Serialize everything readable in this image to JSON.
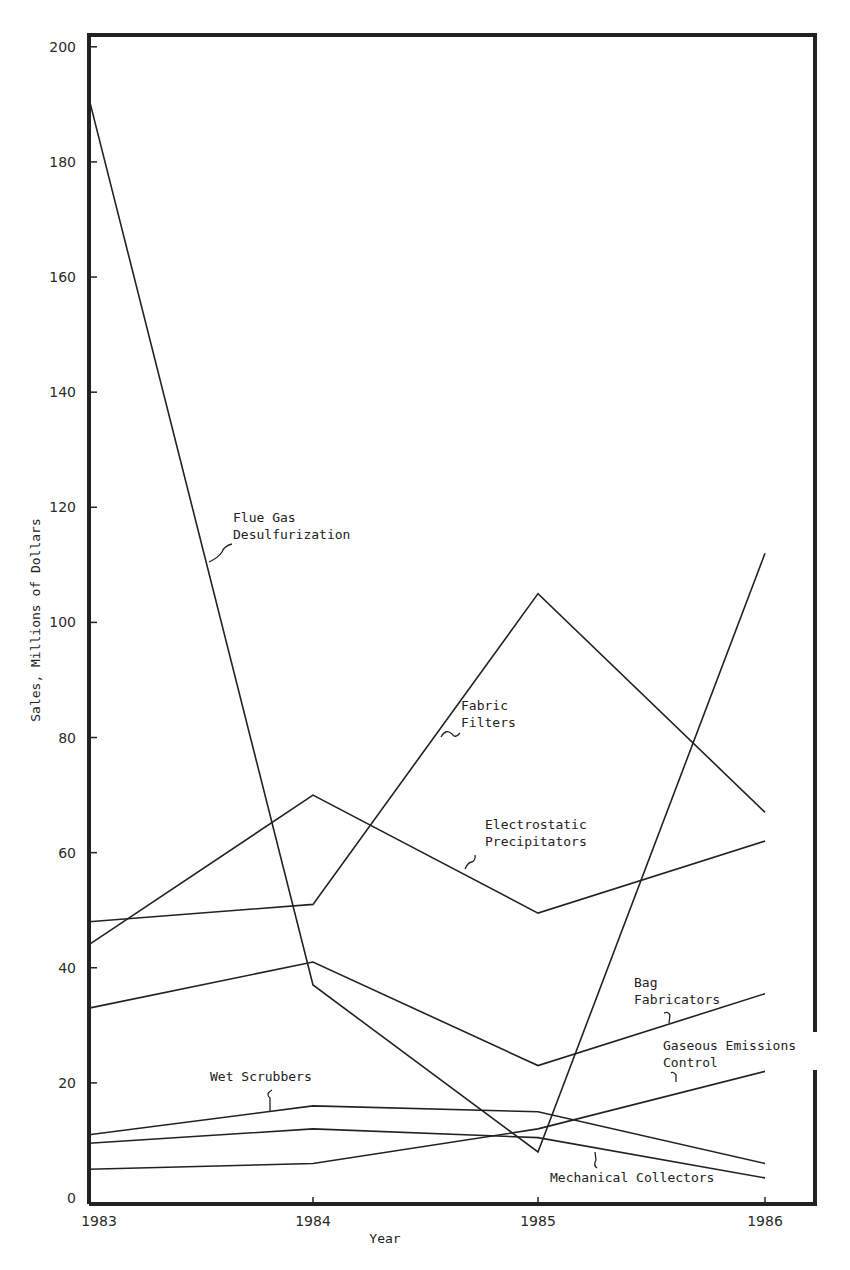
{
  "chart_data": {
    "type": "line",
    "title": "",
    "xlabel": "Year",
    "ylabel": "Sales, Millions of Dollars",
    "x": [
      1983,
      1984,
      1985,
      1986
    ],
    "xticks": [
      "1983",
      "1984",
      "1985",
      "1986"
    ],
    "yticks": [
      "0",
      "20",
      "40",
      "60",
      "80",
      "100",
      "120",
      "140",
      "160",
      "180",
      "200"
    ],
    "ylim": [
      0,
      200
    ],
    "grid": false,
    "legend": "inline labels",
    "series": [
      {
        "name": "Flue Gas Desulfurization",
        "label_lines": [
          "Flue Gas",
          "Desulfurization"
        ],
        "values": [
          191,
          37,
          8,
          112
        ]
      },
      {
        "name": "Fabric Filters",
        "label_lines": [
          "Fabric",
          "Filters"
        ],
        "values": [
          48,
          51,
          105,
          67
        ]
      },
      {
        "name": "Electrostatic Precipitators",
        "label_lines": [
          "Electrostatic",
          "Precipitators"
        ],
        "values": [
          44,
          70,
          49.5,
          62
        ]
      },
      {
        "name": "Bag Fabricators",
        "label_lines": [
          "Bag",
          "Fabricators"
        ],
        "values": [
          33,
          41,
          23,
          35.5
        ]
      },
      {
        "name": "Gaseous Emissions Control",
        "label_lines": [
          "Gaseous Emissions",
          "Control"
        ],
        "values": [
          5,
          6,
          12,
          22
        ]
      },
      {
        "name": "Wet Scrubbers",
        "label_lines": [
          "Wet Scrubbers"
        ],
        "values": [
          11,
          16,
          15,
          6
        ]
      },
      {
        "name": "Mechanical Collectors",
        "label_lines": [
          "Mechanical Collectors"
        ],
        "values": [
          9.5,
          12,
          10.5,
          3.5
        ]
      }
    ]
  }
}
